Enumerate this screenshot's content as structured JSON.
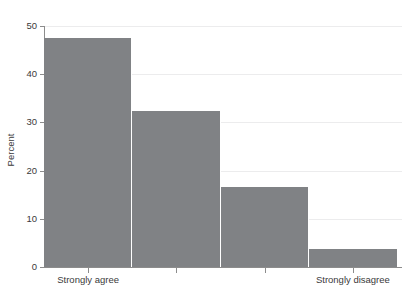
{
  "chart_data": {
    "type": "bar",
    "title": "",
    "subtitle": "",
    "xlabel": "",
    "ylabel": "Percent",
    "categories": [
      "Strongly agree",
      "",
      "",
      "Strongly disagree"
    ],
    "values": [
      47.5,
      32.3,
      16.5,
      3.7
    ],
    "ylim": [
      0,
      50
    ],
    "yticks": [
      0,
      10,
      20,
      30,
      40,
      50
    ],
    "ytick_labels": [
      "0",
      "10",
      "20",
      "30",
      "40",
      "50"
    ],
    "xtick_labels": [
      "Strongly agree",
      "Strongly disagree"
    ],
    "grid": "horizontal",
    "legend": "none",
    "bar_color": "#808285",
    "gridline_color": "#ececed",
    "axis_color": "#8c8c8c",
    "text_color": "#3a3a3a",
    "annotations": []
  },
  "figure": {
    "bleed_top_text": "",
    "bleed_bottom_text": ""
  }
}
